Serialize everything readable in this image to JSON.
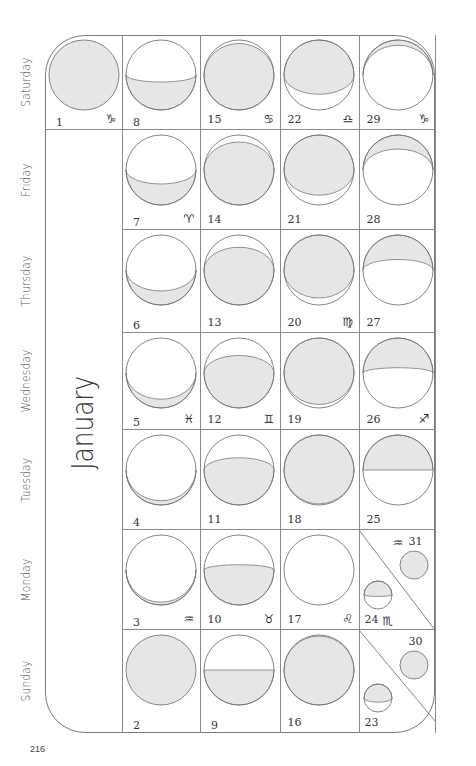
{
  "page_number": "216",
  "calendar": {
    "month": "January",
    "weekdays": [
      "Sunday",
      "Monday",
      "Tuesday",
      "Wednesday",
      "Thursday",
      "Friday",
      "Saturday"
    ],
    "colors": {
      "shadow": "#e6e6e6",
      "line": "#777777",
      "text": "#333333"
    },
    "days": [
      {
        "day": "1",
        "col": 6,
        "row": 0,
        "zodiac": "♑",
        "moon": {
          "shade": "full",
          "k": 1
        }
      },
      {
        "day": "2",
        "col": 0,
        "row": 1,
        "zodiac": "",
        "moon": {
          "shade": "full",
          "k": 1
        }
      },
      {
        "day": "3",
        "col": 1,
        "row": 1,
        "zodiac": "♒",
        "moon": {
          "shade": "bottom",
          "k": 0.92
        }
      },
      {
        "day": "4",
        "col": 2,
        "row": 1,
        "zodiac": "",
        "moon": {
          "shade": "bottom",
          "k": 0.88
        }
      },
      {
        "day": "5",
        "col": 3,
        "row": 1,
        "zodiac": "♓",
        "moon": {
          "shade": "bottom",
          "k": 0.75
        }
      },
      {
        "day": "6",
        "col": 4,
        "row": 1,
        "zodiac": "",
        "moon": {
          "shade": "bottom",
          "k": 0.6
        }
      },
      {
        "day": "7",
        "col": 5,
        "row": 1,
        "zodiac": "♈",
        "moon": {
          "shade": "bottom",
          "k": 0.4
        }
      },
      {
        "day": "8",
        "col": 6,
        "row": 1,
        "zodiac": "",
        "moon": {
          "shade": "bottom",
          "k": 0.2
        }
      },
      {
        "day": "9",
        "col": 0,
        "row": 2,
        "zodiac": "",
        "moon": {
          "shade": "bottom",
          "k": 0
        }
      },
      {
        "day": "10",
        "col": 1,
        "row": 2,
        "zodiac": "♉",
        "moon": {
          "shade": "bottom",
          "k": -0.15
        }
      },
      {
        "day": "11",
        "col": 2,
        "row": 2,
        "zodiac": "",
        "moon": {
          "shade": "bottom",
          "k": -0.35
        }
      },
      {
        "day": "12",
        "col": 3,
        "row": 2,
        "zodiac": "♊",
        "moon": {
          "shade": "bottom",
          "k": -0.5
        }
      },
      {
        "day": "13",
        "col": 4,
        "row": 2,
        "zodiac": "",
        "moon": {
          "shade": "bottom",
          "k": -0.65
        }
      },
      {
        "day": "14",
        "col": 5,
        "row": 2,
        "zodiac": "",
        "moon": {
          "shade": "bottom",
          "k": -0.8
        }
      },
      {
        "day": "15",
        "col": 6,
        "row": 2,
        "zodiac": "♋",
        "moon": {
          "shade": "bottom",
          "k": -0.9
        }
      },
      {
        "day": "16",
        "col": 0,
        "row": 3,
        "zodiac": "",
        "moon": {
          "shade": "bottom",
          "k": -0.97
        }
      },
      {
        "day": "17",
        "col": 1,
        "row": 3,
        "zodiac": "♌",
        "moon": {
          "shade": "none",
          "k": 0
        }
      },
      {
        "day": "18",
        "col": 2,
        "row": 3,
        "zodiac": "",
        "moon": {
          "shade": "top",
          "k": -0.97
        }
      },
      {
        "day": "19",
        "col": 3,
        "row": 3,
        "zodiac": "",
        "moon": {
          "shade": "top",
          "k": -0.9
        }
      },
      {
        "day": "20",
        "col": 4,
        "row": 3,
        "zodiac": "♍",
        "moon": {
          "shade": "top",
          "k": -0.8
        }
      },
      {
        "day": "21",
        "col": 5,
        "row": 3,
        "zodiac": "",
        "moon": {
          "shade": "top",
          "k": -0.72
        }
      },
      {
        "day": "22",
        "col": 6,
        "row": 3,
        "zodiac": "♎",
        "moon": {
          "shade": "top",
          "k": -0.55
        }
      },
      {
        "day": "25",
        "col": 2,
        "row": 4,
        "zodiac": "",
        "moon": {
          "shade": "top",
          "k": 0
        }
      },
      {
        "day": "26",
        "col": 3,
        "row": 4,
        "zodiac": "♐",
        "moon": {
          "shade": "top",
          "k": 0.15
        }
      },
      {
        "day": "27",
        "col": 4,
        "row": 4,
        "zodiac": "",
        "moon": {
          "shade": "top",
          "k": 0.3
        }
      },
      {
        "day": "28",
        "col": 5,
        "row": 4,
        "zodiac": "",
        "moon": {
          "shade": "top",
          "k": 0.6
        }
      },
      {
        "day": "29",
        "col": 6,
        "row": 4,
        "zodiac": "♑",
        "moon": {
          "shade": "top",
          "k": 0.85
        }
      }
    ],
    "split_days": [
      {
        "col": 0,
        "first": {
          "day": "23",
          "zodiac": "",
          "moon": {
            "shade": "top",
            "k": -0.3
          }
        },
        "second": {
          "day": "30",
          "zodiac": "",
          "moon": {
            "shade": "full",
            "k": 1
          }
        }
      },
      {
        "col": 1,
        "first": {
          "day": "24",
          "zodiac": "♏",
          "moon": {
            "shade": "top",
            "k": -0.1
          }
        },
        "second": {
          "day": "31",
          "zodiac": "♒",
          "moon": {
            "shade": "full",
            "k": 1
          }
        }
      }
    ]
  }
}
